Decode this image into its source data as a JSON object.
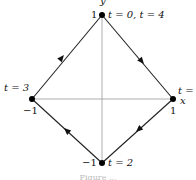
{
  "diagram": {
    "type": "parametric path (diamond |x|+|y|=1)",
    "axes": {
      "x_label": "x",
      "y_label": "y"
    },
    "vertices": [
      {
        "id": "top",
        "coord_label": "1",
        "time_label": "t = 0, t = 4"
      },
      {
        "id": "right",
        "coord_label": "1",
        "time_label": "t ="
      },
      {
        "id": "bottom",
        "coord_label": "−1",
        "time_label": "t = 2"
      },
      {
        "id": "left",
        "coord_label": "−1",
        "time_label": "t = 3"
      }
    ],
    "direction": "clockwise",
    "colors": {
      "edge": "#222222",
      "axis": "#999999",
      "point": "#000000"
    },
    "caption": "Figure ..."
  }
}
